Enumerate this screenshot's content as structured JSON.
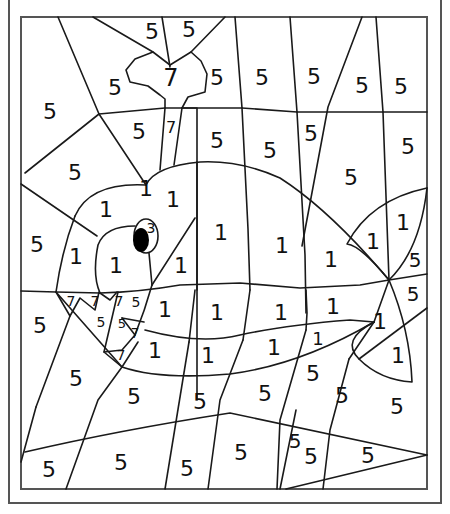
{
  "colors": {
    "line": "#1a1a1a",
    "frame": "#555555",
    "pupil": "#000000",
    "background": "#ffffff"
  },
  "labels": [
    {
      "t": "5",
      "x": 152,
      "y": 31,
      "s": 22
    },
    {
      "t": "5",
      "x": 189,
      "y": 29,
      "s": 22
    },
    {
      "t": "7",
      "x": 171,
      "y": 78,
      "s": 24
    },
    {
      "t": "5",
      "x": 115,
      "y": 87,
      "s": 22
    },
    {
      "t": "5",
      "x": 217,
      "y": 77,
      "s": 22
    },
    {
      "t": "5",
      "x": 262,
      "y": 77,
      "s": 22
    },
    {
      "t": "5",
      "x": 314,
      "y": 76,
      "s": 22
    },
    {
      "t": "5",
      "x": 362,
      "y": 85,
      "s": 22
    },
    {
      "t": "5",
      "x": 401,
      "y": 86,
      "s": 22
    },
    {
      "t": "5",
      "x": 50,
      "y": 111,
      "s": 22
    },
    {
      "t": "5",
      "x": 139,
      "y": 131,
      "s": 22
    },
    {
      "t": "7",
      "x": 171,
      "y": 127,
      "s": 16
    },
    {
      "t": "5",
      "x": 217,
      "y": 140,
      "s": 22
    },
    {
      "t": "5",
      "x": 270,
      "y": 150,
      "s": 22
    },
    {
      "t": "5",
      "x": 311,
      "y": 133,
      "s": 22
    },
    {
      "t": "5",
      "x": 408,
      "y": 146,
      "s": 22
    },
    {
      "t": "5",
      "x": 75,
      "y": 172,
      "s": 22
    },
    {
      "t": "5",
      "x": 351,
      "y": 177,
      "s": 22
    },
    {
      "t": "1",
      "x": 146,
      "y": 188,
      "s": 22
    },
    {
      "t": "1",
      "x": 173,
      "y": 199,
      "s": 22
    },
    {
      "t": "1",
      "x": 106,
      "y": 209,
      "s": 22
    },
    {
      "t": "1",
      "x": 403,
      "y": 222,
      "s": 22
    },
    {
      "t": "5",
      "x": 37,
      "y": 244,
      "s": 22
    },
    {
      "t": "1",
      "x": 76,
      "y": 256,
      "s": 22
    },
    {
      "t": "1",
      "x": 116,
      "y": 265,
      "s": 22
    },
    {
      "t": "3",
      "x": 151,
      "y": 228,
      "s": 14
    },
    {
      "t": "1",
      "x": 221,
      "y": 232,
      "s": 22
    },
    {
      "t": "1",
      "x": 282,
      "y": 245,
      "s": 22
    },
    {
      "t": "1",
      "x": 331,
      "y": 259,
      "s": 22
    },
    {
      "t": "1",
      "x": 373,
      "y": 241,
      "s": 22
    },
    {
      "t": "1",
      "x": 181,
      "y": 265,
      "s": 22
    },
    {
      "t": "5",
      "x": 415,
      "y": 260,
      "s": 20
    },
    {
      "t": "5",
      "x": 413,
      "y": 294,
      "s": 20
    },
    {
      "t": "7",
      "x": 71,
      "y": 301,
      "s": 14
    },
    {
      "t": "7",
      "x": 95,
      "y": 301,
      "s": 14
    },
    {
      "t": "7",
      "x": 119,
      "y": 301,
      "s": 14
    },
    {
      "t": "5",
      "x": 136,
      "y": 302,
      "s": 14
    },
    {
      "t": "1",
      "x": 165,
      "y": 309,
      "s": 22
    },
    {
      "t": "1",
      "x": 217,
      "y": 312,
      "s": 22
    },
    {
      "t": "1",
      "x": 281,
      "y": 312,
      "s": 22
    },
    {
      "t": "1",
      "x": 333,
      "y": 306,
      "s": 22
    },
    {
      "t": "5",
      "x": 40,
      "y": 325,
      "s": 22
    },
    {
      "t": "5",
      "x": 101,
      "y": 322,
      "s": 14
    },
    {
      "t": "5",
      "x": 122,
      "y": 323,
      "s": 13
    },
    {
      "t": "7",
      "x": 135,
      "y": 333,
      "s": 14
    },
    {
      "t": "7",
      "x": 121,
      "y": 355,
      "s": 14
    },
    {
      "t": "1",
      "x": 380,
      "y": 321,
      "s": 22
    },
    {
      "t": "1",
      "x": 155,
      "y": 350,
      "s": 22
    },
    {
      "t": "1",
      "x": 208,
      "y": 355,
      "s": 22
    },
    {
      "t": "1",
      "x": 274,
      "y": 347,
      "s": 22
    },
    {
      "t": "1",
      "x": 318,
      "y": 338,
      "s": 18
    },
    {
      "t": "1",
      "x": 398,
      "y": 355,
      "s": 22
    },
    {
      "t": "5",
      "x": 76,
      "y": 378,
      "s": 22
    },
    {
      "t": "5",
      "x": 313,
      "y": 373,
      "s": 22
    },
    {
      "t": "5",
      "x": 134,
      "y": 396,
      "s": 22
    },
    {
      "t": "5",
      "x": 200,
      "y": 401,
      "s": 22
    },
    {
      "t": "5",
      "x": 265,
      "y": 393,
      "s": 22
    },
    {
      "t": "5",
      "x": 342,
      "y": 395,
      "s": 22
    },
    {
      "t": "5",
      "x": 397,
      "y": 406,
      "s": 22
    },
    {
      "t": "5",
      "x": 295,
      "y": 441,
      "s": 20
    },
    {
      "t": "5",
      "x": 311,
      "y": 456,
      "s": 22
    },
    {
      "t": "5",
      "x": 368,
      "y": 455,
      "s": 22
    },
    {
      "t": "5",
      "x": 49,
      "y": 469,
      "s": 22
    },
    {
      "t": "5",
      "x": 121,
      "y": 462,
      "s": 22
    },
    {
      "t": "5",
      "x": 187,
      "y": 468,
      "s": 22
    },
    {
      "t": "5",
      "x": 241,
      "y": 452,
      "s": 22
    }
  ]
}
